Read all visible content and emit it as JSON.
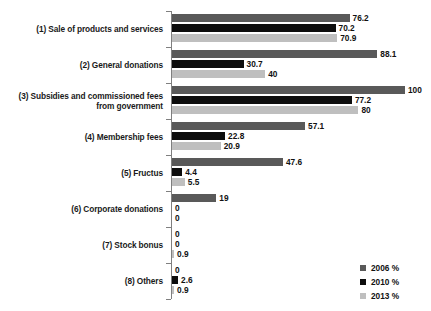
{
  "chart_data": {
    "type": "bar",
    "orientation": "horizontal",
    "title": "",
    "xlabel": "",
    "ylabel": "",
    "xlim": [
      0,
      100
    ],
    "grid": false,
    "legend_position": "bottom-right",
    "categories": [
      "(1) Sale of products and services",
      "(2) General donations",
      "(3) Subsidies and commissioned fees from government",
      "(4) Membership fees",
      "(5) Fructus",
      "(6) Corporate donations",
      "(7) Stock bonus",
      "(8) Others"
    ],
    "series": [
      {
        "name": "2006 %",
        "color": "#595959",
        "values": [
          76.2,
          88.1,
          100,
          57.1,
          47.6,
          19,
          0,
          0
        ],
        "labels": [
          "76.2",
          "88.1",
          "100",
          "57.1",
          "47.6",
          "19",
          "0",
          "0"
        ]
      },
      {
        "name": "2010 %",
        "color": "#0d0d0d",
        "values": [
          70.2,
          30.7,
          77.2,
          22.8,
          4.4,
          0,
          0,
          2.6
        ],
        "labels": [
          "70.2",
          "30.7",
          "77.2",
          "22.8",
          "4.4",
          "0",
          "0",
          "2.6"
        ]
      },
      {
        "name": "2013 %",
        "color": "#bfbfbf",
        "values": [
          70.9,
          40,
          80,
          20.9,
          5.5,
          0,
          0.9,
          0.9
        ],
        "labels": [
          "70.9",
          "40",
          "80",
          "20.9",
          "5.5",
          "0",
          "0.9",
          "0.9"
        ]
      }
    ]
  },
  "legend": {
    "items": [
      {
        "label": "2006 %",
        "key": "s2006"
      },
      {
        "label": "2010 %",
        "key": "s2010"
      },
      {
        "label": "2013 %",
        "key": "s2013"
      }
    ]
  }
}
